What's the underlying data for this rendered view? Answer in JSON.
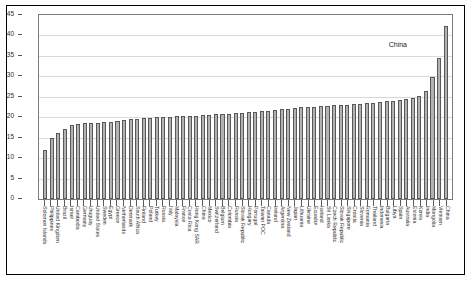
{
  "chart_data": {
    "type": "bar",
    "title": "",
    "subtitle": "",
    "xlabel": "",
    "ylabel": "",
    "ylim": [
      0,
      45
    ],
    "ytick_values": [
      0,
      5,
      10,
      15,
      20,
      25,
      30,
      35,
      40,
      45
    ],
    "ytick_labels": [
      "0",
      "5",
      "10",
      "15",
      "20",
      "25",
      "30",
      "35",
      "40",
      "45"
    ],
    "grid": true,
    "legend": false,
    "legend_position": "none",
    "bar_color": "#b2b2b2",
    "bar_edge_color": "#585858",
    "annotations": [
      {
        "text": "China",
        "target_category": "China",
        "value": 42.3
      }
    ],
    "categories": [
      "Solomon Islands",
      "Philippines",
      "United Kingdom",
      "Brazil",
      "Israel",
      "Cambodia",
      "Germany",
      "Uruguay",
      "United States",
      "Sweden",
      "Egypt",
      "Greece",
      "Netherlands",
      "Denmark",
      "South Africa",
      "Finland",
      "Poland",
      "Turkey",
      "Russia",
      "Italy",
      "Malaysia",
      "France",
      "Costa Rica",
      "Hong Kong SAR",
      "China",
      "Mexico",
      "Switzerland",
      "Belgium",
      "Colombia",
      "Russia",
      "Slovak Republic",
      "Hungary",
      "Portugal",
      "Taiwan POC",
      "Canada",
      "Ireland",
      "Argentina",
      "New Zealand",
      "Japan",
      "Lithuania",
      "Ukraine",
      "Ecuador",
      "Iceland",
      "Sri Lanka",
      "Czech Republic",
      "Slovak Republic",
      "Singapore",
      "Croatia",
      "Slovenia",
      "Romania",
      "Thailand",
      "Indonesia",
      "Bulgaria",
      "Libya",
      "Spain",
      "Australia",
      "Estonia",
      "Korea",
      "India",
      "Mongolia",
      "Vietnam",
      "China"
    ],
    "values": [
      11.9,
      14.9,
      16.2,
      17.2,
      18.0,
      18.3,
      18.6,
      18.6,
      18.7,
      18.8,
      18.9,
      19.0,
      19.4,
      19.6,
      19.6,
      19.8,
      19.9,
      20.0,
      20.1,
      20.1,
      20.2,
      20.2,
      20.3,
      20.4,
      20.5,
      20.6,
      20.7,
      20.8,
      20.9,
      21.0,
      21.1,
      21.2,
      21.3,
      21.5,
      21.6,
      21.8,
      21.9,
      22.0,
      22.2,
      22.4,
      22.5,
      22.6,
      22.7,
      22.8,
      22.9,
      23.0,
      23.1,
      23.2,
      23.3,
      23.4,
      23.5,
      23.7,
      23.9,
      24.0,
      24.2,
      24.4,
      24.6,
      25.3,
      26.4,
      29.8,
      34.6,
      42.3
    ]
  }
}
